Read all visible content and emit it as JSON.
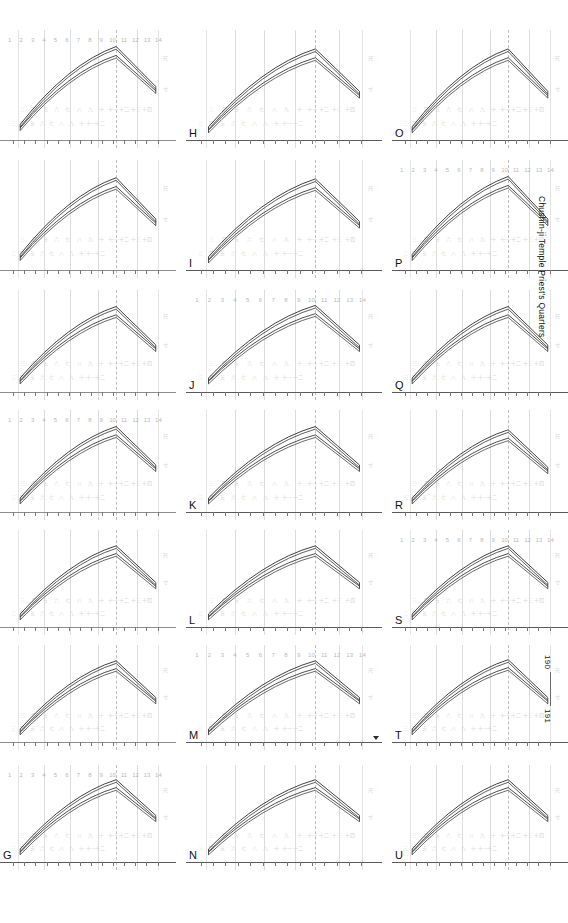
{
  "document": {
    "caption": "Chushin-ji Temple Priest's Quarters",
    "page_legend": {
      "from": "190",
      "to": "191"
    }
  },
  "scale": {
    "ticks": [
      "1",
      "2",
      "3",
      "4",
      "5",
      "6",
      "7",
      "8",
      "9",
      "10",
      "11",
      "12",
      "13",
      "14"
    ],
    "micro_right": [
      "尺",
      "寸"
    ],
    "ghost_dimensions": [
      "三",
      "四",
      "五",
      "六",
      "七",
      "八",
      "九",
      "十",
      "十一",
      "十二",
      "十三",
      "十四"
    ]
  },
  "chart_data": {
    "type": "line",
    "title": "Chushin-ji Temple Priest's Quarters",
    "xlabel": "",
    "ylabel": "",
    "x": [
      1,
      2,
      3,
      4,
      5,
      6,
      7,
      8,
      9,
      10,
      11,
      12,
      13,
      14
    ],
    "xlim": [
      1,
      14
    ],
    "ylim": [
      0,
      100
    ],
    "grid": true,
    "legend": "none",
    "series": [
      {
        "name": "roof-upper-surface",
        "values": [
          30,
          34,
          39,
          44,
          50,
          56,
          62,
          69,
          76,
          84,
          93,
          72,
          62,
          55
        ]
      },
      {
        "name": "roof-lower-surface",
        "values": [
          27,
          31,
          36,
          41,
          46,
          52,
          58,
          65,
          72,
          79,
          86,
          68,
          58,
          51
        ]
      }
    ],
    "annotations": [
      {
        "text": "peak",
        "x": 11
      },
      {
        "text": "eave-end",
        "x": 14
      }
    ]
  },
  "panels": [
    {
      "id": "G",
      "label": "G",
      "row": 6,
      "col": 0,
      "show_numscale": true,
      "peak_x": 0.66,
      "start_y": 0.8,
      "peak_y": 0.14,
      "end_y": 0.48
    },
    {
      "id": "H",
      "label": "H",
      "row": 0,
      "col": 1,
      "show_numscale": false,
      "peak_x": 0.66,
      "start_y": 0.82,
      "peak_y": 0.16,
      "end_y": 0.52
    },
    {
      "id": "I",
      "label": "I",
      "row": 1,
      "col": 1,
      "show_numscale": false,
      "peak_x": 0.66,
      "start_y": 0.82,
      "peak_y": 0.16,
      "end_y": 0.52
    },
    {
      "id": "J",
      "label": "J",
      "row": 2,
      "col": 1,
      "show_numscale": true,
      "peak_x": 0.66,
      "start_y": 0.8,
      "peak_y": 0.14,
      "end_y": 0.5
    },
    {
      "id": "K",
      "label": "K",
      "row": 3,
      "col": 1,
      "show_numscale": false,
      "peak_x": 0.66,
      "start_y": 0.8,
      "peak_y": 0.15,
      "end_y": 0.5
    },
    {
      "id": "L",
      "label": "L",
      "row": 4,
      "col": 1,
      "show_numscale": false,
      "peak_x": 0.66,
      "start_y": 0.8,
      "peak_y": 0.15,
      "end_y": 0.5
    },
    {
      "id": "M",
      "label": "M",
      "row": 5,
      "col": 1,
      "show_numscale": true,
      "peak_x": 0.66,
      "start_y": 0.8,
      "peak_y": 0.15,
      "end_y": 0.5
    },
    {
      "id": "N",
      "label": "N",
      "row": 6,
      "col": 1,
      "show_numscale": false,
      "peak_x": 0.66,
      "start_y": 0.8,
      "peak_y": 0.14,
      "end_y": 0.48
    },
    {
      "id": "O",
      "label": "O",
      "row": 0,
      "col": 2,
      "show_numscale": false,
      "peak_x": 0.66,
      "start_y": 0.82,
      "peak_y": 0.16,
      "end_y": 0.52
    },
    {
      "id": "P",
      "label": "P",
      "row": 1,
      "col": 2,
      "show_numscale": true,
      "peak_x": 0.66,
      "start_y": 0.8,
      "peak_y": 0.14,
      "end_y": 0.5
    },
    {
      "id": "Q",
      "label": "Q",
      "row": 2,
      "col": 2,
      "show_numscale": false,
      "peak_x": 0.66,
      "start_y": 0.8,
      "peak_y": 0.15,
      "end_y": 0.5
    },
    {
      "id": "R",
      "label": "R",
      "row": 3,
      "col": 2,
      "show_numscale": false,
      "peak_x": 0.66,
      "start_y": 0.8,
      "peak_y": 0.18,
      "end_y": 0.52
    },
    {
      "id": "S",
      "label": "S",
      "row": 4,
      "col": 2,
      "show_numscale": true,
      "peak_x": 0.66,
      "start_y": 0.8,
      "peak_y": 0.15,
      "end_y": 0.5
    },
    {
      "id": "T",
      "label": "T",
      "row": 5,
      "col": 2,
      "show_numscale": false,
      "peak_x": 0.66,
      "start_y": 0.8,
      "peak_y": 0.14,
      "end_y": 0.5
    },
    {
      "id": "U",
      "label": "U",
      "row": 6,
      "col": 2,
      "show_numscale": false,
      "peak_x": 0.66,
      "start_y": 0.8,
      "peak_y": 0.14,
      "end_y": 0.48
    },
    {
      "id": "A1",
      "label": "",
      "row": 0,
      "col": 0,
      "show_numscale": true,
      "peak_x": 0.66,
      "start_y": 0.8,
      "peak_y": 0.14,
      "end_y": 0.48
    },
    {
      "id": "A2",
      "label": "",
      "row": 1,
      "col": 0,
      "show_numscale": false,
      "peak_x": 0.66,
      "start_y": 0.8,
      "peak_y": 0.15,
      "end_y": 0.5
    },
    {
      "id": "A3",
      "label": "",
      "row": 2,
      "col": 0,
      "show_numscale": false,
      "peak_x": 0.66,
      "start_y": 0.8,
      "peak_y": 0.15,
      "end_y": 0.5
    },
    {
      "id": "A4",
      "label": "",
      "row": 3,
      "col": 0,
      "show_numscale": true,
      "peak_x": 0.66,
      "start_y": 0.8,
      "peak_y": 0.15,
      "end_y": 0.5
    },
    {
      "id": "A5",
      "label": "",
      "row": 4,
      "col": 0,
      "show_numscale": false,
      "peak_x": 0.66,
      "start_y": 0.8,
      "peak_y": 0.15,
      "end_y": 0.5
    },
    {
      "id": "A6",
      "label": "",
      "row": 5,
      "col": 0,
      "show_numscale": false,
      "peak_x": 0.66,
      "start_y": 0.8,
      "peak_y": 0.15,
      "end_y": 0.5
    }
  ]
}
